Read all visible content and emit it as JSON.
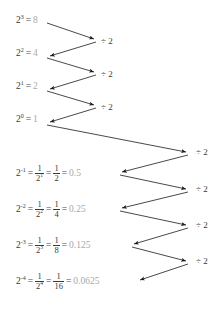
{
  "diagram": {
    "type": "zigzag-arrow-chain",
    "colors": {
      "text": "#3a3a3a",
      "value": "#a8a8a8",
      "arrow": "#1a1a1a",
      "background": "#ffffff"
    },
    "equals": "=",
    "operation_label": "÷ 2",
    "rows": [
      {
        "id": "row-2-pow-3",
        "base": "2",
        "exponent": "3",
        "value": "8",
        "has_fraction": false
      },
      {
        "id": "row-2-pow-2",
        "base": "2",
        "exponent": "2",
        "value": "4",
        "has_fraction": false
      },
      {
        "id": "row-2-pow-1",
        "base": "2",
        "exponent": "1",
        "value": "2",
        "has_fraction": false
      },
      {
        "id": "row-2-pow-0",
        "base": "2",
        "exponent": "0",
        "value": "1",
        "has_fraction": false
      },
      {
        "id": "row-2-pow-neg1",
        "base": "2",
        "exponent": "-1",
        "fraction_1_num": "1",
        "fraction_1_den_base": "2",
        "fraction_1_den_exp": "1",
        "fraction_2_num": "1",
        "fraction_2_den": "2",
        "value": "0.5",
        "has_fraction": true
      },
      {
        "id": "row-2-pow-neg2",
        "base": "2",
        "exponent": "-2",
        "fraction_1_num": "1",
        "fraction_1_den_base": "2",
        "fraction_1_den_exp": "2",
        "fraction_2_num": "1",
        "fraction_2_den": "4",
        "value": "0.25",
        "has_fraction": true
      },
      {
        "id": "row-2-pow-neg3",
        "base": "2",
        "exponent": "-3",
        "fraction_1_num": "1",
        "fraction_1_den_base": "2",
        "fraction_1_den_exp": "3",
        "fraction_2_num": "1",
        "fraction_2_den": "8",
        "value": "0.125",
        "has_fraction": true
      },
      {
        "id": "row-2-pow-neg4",
        "base": "2",
        "exponent": "-4",
        "fraction_1_num": "1",
        "fraction_1_den_base": "2",
        "fraction_1_den_exp": "4",
        "fraction_2_num": "1",
        "fraction_2_den": "16",
        "value": "0.0625",
        "has_fraction": true
      }
    ],
    "operation_labels": [
      {
        "id": "op-1",
        "text": "÷ 2"
      },
      {
        "id": "op-2",
        "text": "÷ 2"
      },
      {
        "id": "op-3",
        "text": "÷ 2"
      },
      {
        "id": "op-4",
        "text": "÷ 2"
      },
      {
        "id": "op-5",
        "text": "÷ 2"
      },
      {
        "id": "op-6",
        "text": "÷ 2"
      },
      {
        "id": "op-7",
        "text": "÷ 2"
      }
    ]
  }
}
